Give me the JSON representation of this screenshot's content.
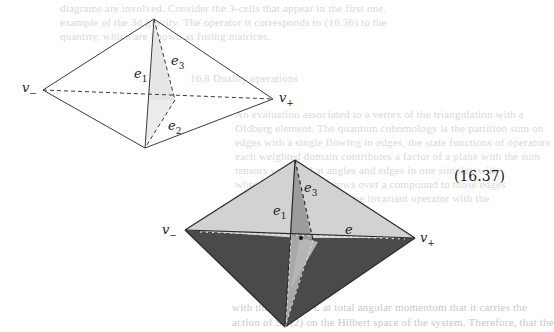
{
  "background_text": {
    "lines": [
      "diagrams are involved. Consider the 3-cells that appear in the first one.",
      "example of the 3d gravity. The operator it corresponds to (16.36) to the",
      "quantity, which are known as fusing matrices.",
      "16.8 Duality operations",
      "An evaluation associated to a vertex of the triangulation with a",
      "Oldberg element. The quantum cohomology is the partition sum on",
      "edges with a single flowing in edges, the state functions of operators",
      "each weighted domain contributes a factor of a plane with the sum",
      "tensors weighted at angles and edges in one simplex with",
      "where we label the arrows over a compound to those edges",
      "that the state sum is a gauge invariant operator with the",
      "the output of the dual.",
      "with the operator L at total angular momentum that it carries the",
      "action of SU(2) on the Hilbert space of the system. Therefore, that the"
    ]
  },
  "figure_top": {
    "labels": {
      "v_minus": "v",
      "v_minus_sub": "−",
      "v_plus": "v",
      "v_plus_sub": "+",
      "e1": "e",
      "e1_sub": "1",
      "e2": "e",
      "e2_sub": "2",
      "e3": "e",
      "e3_sub": "3"
    }
  },
  "figure_bottom": {
    "labels": {
      "v_minus": "v",
      "v_minus_sub": "−",
      "v_plus": "v",
      "v_plus_sub": "+",
      "e1": "e",
      "e1_sub": "1",
      "e3": "e",
      "e3_sub": "3",
      "e": "e"
    }
  },
  "equation_number": "(16.37)",
  "colors": {
    "line": "#3a3a3a",
    "light_face": "#d4d4d4",
    "mid_face": "#a8a8a8",
    "dark_face": "#4a4a4a",
    "bleed_text": "#d9d9d9"
  }
}
